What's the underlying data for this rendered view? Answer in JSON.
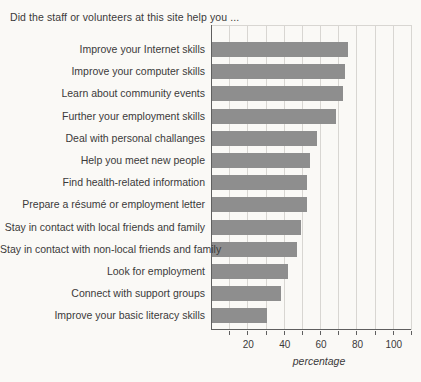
{
  "page": {
    "background": "#faf9f6"
  },
  "chart_data": {
    "type": "bar",
    "orientation": "horizontal",
    "title": "Did the staff or volunteers at this site help you ...",
    "categories": [
      "Improve your Internet skills",
      "Improve your computer skills",
      "Learn about community events",
      "Further your employment skills",
      "Deal with personal challanges",
      "Help you meet new people",
      "Find health-related information",
      "Prepare a résumé or employment letter",
      "Stay in contact with local friends and family",
      "Stay in contact with non-local friends and family",
      "Look for employment",
      "Connect with support groups",
      "Improve your basic literacy skills"
    ],
    "values": [
      75,
      73,
      72,
      68,
      58,
      54,
      52,
      52,
      49,
      47,
      42,
      38,
      30
    ],
    "xlabel": "percentage",
    "xlim": [
      0,
      110
    ],
    "xticks": [
      20,
      40,
      60,
      80,
      100
    ],
    "gridline_step": 10,
    "grid": "vertical",
    "legend": "none",
    "colors": {
      "bar": "#8e8e8e",
      "gridline": "#d8d6d2",
      "axis": "#5f5f5f",
      "text": "#3a3a3a"
    }
  }
}
